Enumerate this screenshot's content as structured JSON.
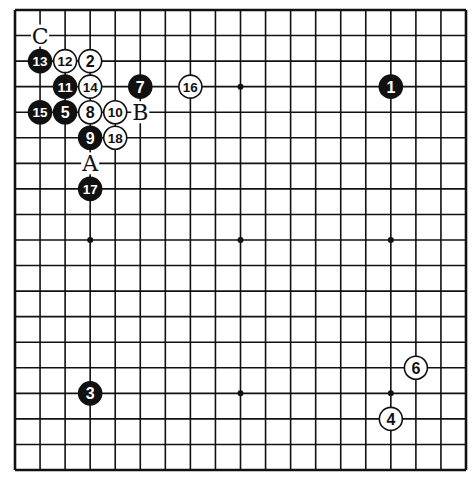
{
  "diagram": {
    "type": "go-board",
    "size": 19,
    "geometry": {
      "left": 15,
      "top": 10,
      "right": 466,
      "bottom": 470
    },
    "colors": {
      "line": "#111111",
      "black_stone": "#111111",
      "white_stone": "#ffffff",
      "background": "#ffffff"
    },
    "star_points": [
      [
        3,
        3
      ],
      [
        9,
        3
      ],
      [
        15,
        3
      ],
      [
        3,
        9
      ],
      [
        9,
        9
      ],
      [
        15,
        9
      ],
      [
        3,
        15
      ],
      [
        9,
        15
      ],
      [
        15,
        15
      ]
    ],
    "stones": [
      {
        "move": "1",
        "color": "black",
        "col": 15,
        "row": 3
      },
      {
        "move": "2",
        "color": "white",
        "col": 3,
        "row": 2
      },
      {
        "move": "3",
        "color": "black",
        "col": 3,
        "row": 15
      },
      {
        "move": "4",
        "color": "white",
        "col": 15,
        "row": 16
      },
      {
        "move": "5",
        "color": "black",
        "col": 2,
        "row": 4
      },
      {
        "move": "6",
        "color": "white",
        "col": 16,
        "row": 14
      },
      {
        "move": "7",
        "color": "black",
        "col": 5,
        "row": 3
      },
      {
        "move": "8",
        "color": "white",
        "col": 3,
        "row": 4
      },
      {
        "move": "9",
        "color": "black",
        "col": 3,
        "row": 5
      },
      {
        "move": "10",
        "color": "white",
        "col": 4,
        "row": 4
      },
      {
        "move": "11",
        "color": "black",
        "col": 2,
        "row": 3
      },
      {
        "move": "12",
        "color": "white",
        "col": 2,
        "row": 2
      },
      {
        "move": "13",
        "color": "black",
        "col": 1,
        "row": 2
      },
      {
        "move": "14",
        "color": "white",
        "col": 3,
        "row": 3
      },
      {
        "move": "15",
        "color": "black",
        "col": 1,
        "row": 4
      },
      {
        "move": "16",
        "color": "white",
        "col": 7,
        "row": 3
      },
      {
        "move": "17",
        "color": "black",
        "col": 3,
        "row": 7
      },
      {
        "move": "18",
        "color": "white",
        "col": 4,
        "row": 5
      }
    ],
    "labels": [
      {
        "text": "A",
        "col": 3,
        "row": 6
      },
      {
        "text": "B",
        "col": 5,
        "row": 4
      },
      {
        "text": "C",
        "col": 1,
        "row": 1
      }
    ]
  }
}
